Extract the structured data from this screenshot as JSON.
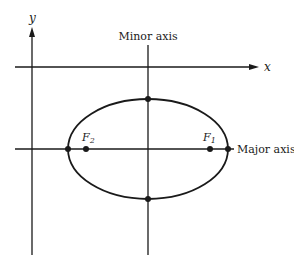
{
  "diagram": {
    "type": "ellipse-axes",
    "colors": {
      "stroke": "#1a1a1a",
      "background": "#ffffff"
    },
    "labels": {
      "y_axis": "y",
      "x_axis": "x",
      "minor_axis": "Minor axis",
      "major_axis": "Major axis",
      "focus_1": "F",
      "focus_1_sub": "1",
      "focus_2": "F",
      "focus_2_sub": "2"
    },
    "ellipse": {
      "cx": 148,
      "cy": 149,
      "rx": 80,
      "ry": 50
    },
    "vertices": [
      {
        "name": "left-vertex",
        "x": 68,
        "y": 149
      },
      {
        "name": "right-vertex",
        "x": 228,
        "y": 149
      },
      {
        "name": "top-covertex",
        "x": 148,
        "y": 99
      },
      {
        "name": "bottom-covertex",
        "x": 148,
        "y": 199
      }
    ],
    "foci": [
      {
        "name": "F1",
        "x": 210,
        "y": 149
      },
      {
        "name": "F2",
        "x": 86,
        "y": 149
      }
    ]
  }
}
